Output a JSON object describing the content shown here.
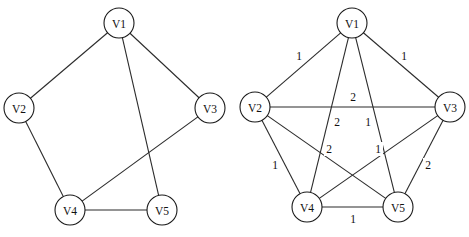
{
  "figure": {
    "title": "",
    "background_color": "#ffffff",
    "stroke_color": "#2b2b2b",
    "node_fill_color": "#ffffff",
    "text_color": "#111111",
    "width": 469,
    "height": 237
  },
  "graphs": [
    {
      "id": "left-graph",
      "name": "spanning-subgraph",
      "weighted": false,
      "node_radius": 15,
      "nodes": [
        {
          "id": "V1",
          "label": "V1",
          "x": 119,
          "y": 23
        },
        {
          "id": "V2",
          "label": "V2",
          "x": 19,
          "y": 108
        },
        {
          "id": "V3",
          "label": "V3",
          "x": 210,
          "y": 108
        },
        {
          "id": "V4",
          "label": "V4",
          "x": 70,
          "y": 210
        },
        {
          "id": "V5",
          "label": "V5",
          "x": 162,
          "y": 210
        }
      ],
      "edges": [
        {
          "from": "V1",
          "to": "V2"
        },
        {
          "from": "V1",
          "to": "V3"
        },
        {
          "from": "V1",
          "to": "V5"
        },
        {
          "from": "V2",
          "to": "V4"
        },
        {
          "from": "V3",
          "to": "V4"
        },
        {
          "from": "V4",
          "to": "V5"
        }
      ]
    },
    {
      "id": "right-graph",
      "name": "complete-weighted-graph",
      "weighted": true,
      "node_radius": 15,
      "nodes": [
        {
          "id": "V1",
          "label": "V1",
          "x": 352,
          "y": 23
        },
        {
          "id": "V2",
          "label": "V2",
          "x": 255,
          "y": 107
        },
        {
          "id": "V3",
          "label": "V3",
          "x": 450,
          "y": 107
        },
        {
          "id": "V4",
          "label": "V4",
          "x": 307,
          "y": 207
        },
        {
          "id": "V5",
          "label": "V5",
          "x": 398,
          "y": 207
        }
      ],
      "edges": [
        {
          "from": "V1",
          "to": "V2",
          "weight": "1",
          "label_x": 299,
          "label_y": 56
        },
        {
          "from": "V1",
          "to": "V3",
          "weight": "1",
          "label_x": 404,
          "label_y": 56
        },
        {
          "from": "V1",
          "to": "V4",
          "weight": "2",
          "label_x": 337,
          "label_y": 122
        },
        {
          "from": "V1",
          "to": "V5",
          "weight": "1",
          "label_x": 368,
          "label_y": 122
        },
        {
          "from": "V2",
          "to": "V3",
          "weight": "2",
          "label_x": 353,
          "label_y": 97
        },
        {
          "from": "V2",
          "to": "V4",
          "weight": "1",
          "label_x": 275,
          "label_y": 165
        },
        {
          "from": "V2",
          "to": "V5",
          "weight": "2",
          "label_x": 329,
          "label_y": 149
        },
        {
          "from": "V3",
          "to": "V4",
          "weight": "1",
          "label_x": 378,
          "label_y": 149
        },
        {
          "from": "V3",
          "to": "V5",
          "weight": "2",
          "label_x": 428,
          "label_y": 165
        },
        {
          "from": "V4",
          "to": "V5",
          "weight": "1",
          "label_x": 353,
          "label_y": 219
        }
      ]
    }
  ]
}
